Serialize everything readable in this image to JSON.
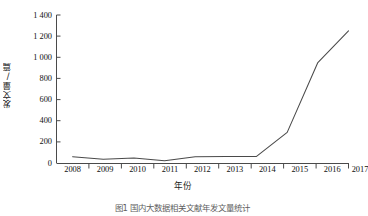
{
  "chart_data": {
    "type": "line",
    "title": "",
    "xlabel": "年份",
    "ylabel": "发文量/篇",
    "categories": [
      "2008",
      "2009",
      "2010",
      "2011",
      "2012",
      "2013",
      "2014",
      "2015",
      "2016",
      "2017"
    ],
    "x": [
      2008,
      2009,
      2010,
      2011,
      2012,
      2013,
      2014,
      2015,
      2016,
      2017
    ],
    "values": [
      60,
      35,
      48,
      22,
      60,
      62,
      62,
      290,
      950,
      1250
    ],
    "series": [
      {
        "name": "发文量",
        "values": [
          60,
          35,
          48,
          22,
          60,
          62,
          62,
          290,
          950,
          1250
        ]
      }
    ],
    "ylim": [
      0,
      1400
    ],
    "xlim": [
      2008,
      2017
    ],
    "ytick_labels": [
      "1 400",
      "1 200",
      "1 000",
      "800",
      "600",
      "400",
      "200",
      "0"
    ],
    "ytick_values": [
      1400,
      1200,
      1000,
      800,
      600,
      400,
      200,
      0
    ],
    "xtick_labels": [
      "2008",
      "2009",
      "2010",
      "2011",
      "2012",
      "2013",
      "2014",
      "2015",
      "2016",
      "2017"
    ],
    "grid": false,
    "legend": "none",
    "line_color": "#4a4a4a",
    "axis_color": "#4a4a4a"
  },
  "axis": {
    "y_title": "发文量/篇",
    "x_title": "年份",
    "ytick_0": "1 400",
    "ytick_1": "1 200",
    "ytick_2": "1 000",
    "ytick_3": "800",
    "ytick_4": "600",
    "ytick_5": "400",
    "ytick_6": "200",
    "ytick_7": "0",
    "xtick_0": "2008",
    "xtick_1": "2009",
    "xtick_2": "2010",
    "xtick_3": "2011",
    "xtick_4": "2012",
    "xtick_5": "2013",
    "xtick_6": "2014",
    "xtick_7": "2015",
    "xtick_8": "2016",
    "xtick_9": "2017"
  },
  "caption": {
    "text": "图1  国内大数据相关文献年发文量统计"
  },
  "colors": {
    "line": "#4a4a4a",
    "axis": "#4a4a4a",
    "text": "#111111",
    "background": "#ffffff"
  }
}
